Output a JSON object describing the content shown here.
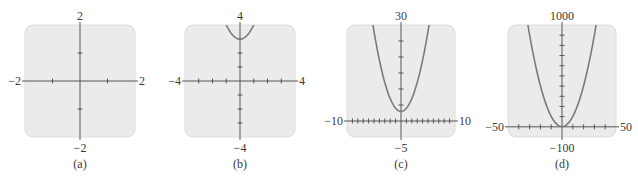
{
  "colors": {
    "box_fill": "#ebebeb",
    "box_border": "#dcdcdc",
    "axis": "#555555",
    "curve": "#7a7a7a"
  },
  "chart_data": [
    {
      "type": "line",
      "caption": "(a)",
      "xlim": [
        -2,
        2
      ],
      "ylim": [
        -2,
        2
      ],
      "x_tick_step": 1,
      "y_tick_step": 1,
      "labels": {
        "top": "2",
        "bottom": "−2",
        "left": "−2",
        "right": "2"
      },
      "series": [],
      "grid": false
    },
    {
      "type": "line",
      "caption": "(b)",
      "xlim": [
        -4,
        4
      ],
      "ylim": [
        -4,
        4
      ],
      "x_tick_step": 1,
      "y_tick_step": 1,
      "labels": {
        "top": "4",
        "bottom": "−4",
        "left": "−4",
        "right": "4"
      },
      "series": [
        {
          "name": "parabola",
          "function": "y = x^2 + 3",
          "vertex": [
            0,
            3
          ]
        }
      ],
      "grid": false
    },
    {
      "type": "line",
      "caption": "(c)",
      "xlim": [
        -10,
        10
      ],
      "ylim": [
        -5,
        30
      ],
      "x_tick_step": 1,
      "y_tick_step": 5,
      "labels": {
        "top": "30",
        "bottom": "−5",
        "left": "−10",
        "right": "10"
      },
      "series": [
        {
          "name": "parabola",
          "function": "y = x^2 + 3",
          "vertex": [
            0,
            3
          ]
        }
      ],
      "grid": false
    },
    {
      "type": "line",
      "caption": "(d)",
      "xlim": [
        -50,
        50
      ],
      "ylim": [
        -100,
        1000
      ],
      "x_tick_step": 10,
      "y_tick_step": 100,
      "labels": {
        "top": "1000",
        "bottom": "−100",
        "left": "−50",
        "right": "50"
      },
      "series": [
        {
          "name": "parabola",
          "function": "y = x^2 + 3",
          "vertex": [
            0,
            3
          ]
        }
      ],
      "grid": false
    }
  ],
  "layout": [
    {
      "bx": 25,
      "by": 25,
      "bw": 110,
      "bh": 112,
      "capx": 70
    },
    {
      "bx": 185,
      "by": 25,
      "bw": 110,
      "bh": 112,
      "capx": 230
    },
    {
      "bx": 347,
      "by": 25,
      "bw": 108,
      "bh": 112,
      "capx": 392
    },
    {
      "bx": 508,
      "by": 25,
      "bw": 108,
      "bh": 112,
      "capx": 552
    }
  ]
}
